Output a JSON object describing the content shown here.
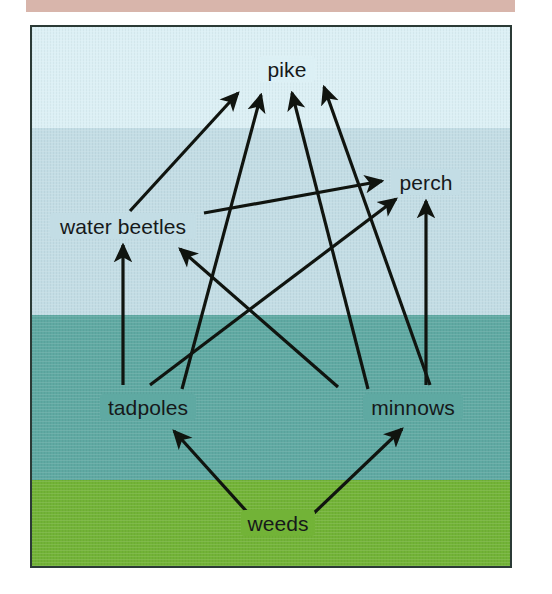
{
  "figure": {
    "type": "food-web-diagram",
    "panel": {
      "border_color": "#2b3a36",
      "width": 482,
      "height": 543
    },
    "top_band": {
      "color": "#d8b5ab"
    }
  },
  "habitat_layers": [
    {
      "name": "surface-water",
      "color": "#dcf0f5",
      "top": 0,
      "height": 101
    },
    {
      "name": "upper-water",
      "color": "#c3dde5",
      "top": 101,
      "height": 187
    },
    {
      "name": "deep-water",
      "color": "#5fa9a2",
      "top": 288,
      "height": 165
    },
    {
      "name": "pond-bed",
      "color": "#72b337",
      "top": 453,
      "height": 88
    }
  ],
  "nodes": [
    {
      "id": "pike",
      "label": "pike",
      "x": 255,
      "y": 42,
      "w": 52,
      "h": 24
    },
    {
      "id": "perch",
      "label": "perch",
      "x": 394,
      "y": 155,
      "w": 66,
      "h": 24
    },
    {
      "id": "water_beetles",
      "label": "water beetles",
      "x": 91,
      "y": 199,
      "w": 142,
      "h": 24
    },
    {
      "id": "tadpoles",
      "label": "tadpoles",
      "x": 116,
      "y": 380,
      "w": 92,
      "h": 24
    },
    {
      "id": "minnows",
      "label": "minnows",
      "x": 381,
      "y": 380,
      "w": 96,
      "h": 24
    },
    {
      "id": "weeds",
      "label": "weeds",
      "x": 246,
      "y": 496,
      "w": 70,
      "h": 24
    }
  ],
  "edges": [
    {
      "from": "water_beetles",
      "to": "pike",
      "label": "water beetles → pike"
    },
    {
      "from": "tadpoles",
      "to": "pike",
      "label": "tadpoles → pike"
    },
    {
      "from": "minnows",
      "to": "pike",
      "label": "minnows → pike"
    },
    {
      "from": "minnows",
      "to": "pike",
      "label": "minnows → pike (outer)"
    },
    {
      "from": "water_beetles",
      "to": "perch",
      "label": "water beetles → perch"
    },
    {
      "from": "tadpoles",
      "to": "perch",
      "label": "tadpoles → perch"
    },
    {
      "from": "minnows",
      "to": "perch",
      "label": "minnows → perch"
    },
    {
      "from": "tadpoles",
      "to": "water_beetles",
      "label": "tadpoles → water beetles"
    },
    {
      "from": "minnows",
      "to": "water_beetles",
      "label": "minnows → water beetles"
    },
    {
      "from": "weeds",
      "to": "tadpoles",
      "label": "weeds → tadpoles"
    },
    {
      "from": "weeds",
      "to": "minnows",
      "label": "weeds → minnows"
    }
  ],
  "style": {
    "arrow_color": "#10140f",
    "label_color": "#16191a",
    "arrow_width": 3.2
  }
}
